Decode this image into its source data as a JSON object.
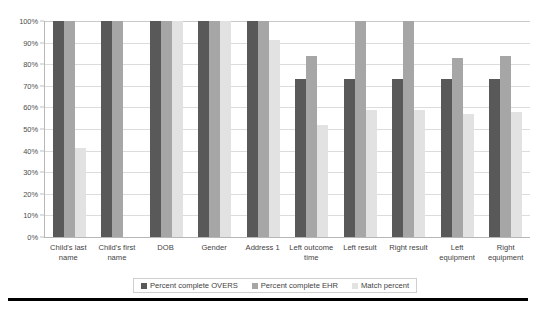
{
  "chart_data": {
    "type": "bar",
    "title": "",
    "xlabel": "",
    "ylabel": "",
    "ylim": [
      0,
      100
    ],
    "ytick_labels": [
      "100%",
      "90%",
      "80%",
      "70%",
      "60%",
      "50%",
      "40%",
      "30%",
      "20%",
      "10%",
      "0%"
    ],
    "ytick_values": [
      100,
      90,
      80,
      70,
      60,
      50,
      40,
      30,
      20,
      10,
      0
    ],
    "grid": true,
    "legend_position": "bottom",
    "categories": [
      "Child's last name",
      "Child's first name",
      "DOB",
      "Gender",
      "Address 1",
      "Left outcome time",
      "Left result",
      "Right result",
      "Left equipment",
      "Right equipment"
    ],
    "series": [
      {
        "name": "Percent complete OVERS",
        "color": "#595959",
        "values": [
          100,
          100,
          100,
          100,
          100,
          73,
          73,
          73,
          73,
          73
        ]
      },
      {
        "name": "Percent complete EHR",
        "color": "#a6a6a6",
        "values": [
          100,
          100,
          100,
          100,
          100,
          84,
          100,
          100,
          83,
          84
        ]
      },
      {
        "name": "Match percent",
        "color": "#e2e2e2",
        "values": [
          41,
          0,
          100,
          100,
          91,
          52,
          59,
          59,
          57,
          58
        ]
      }
    ]
  }
}
